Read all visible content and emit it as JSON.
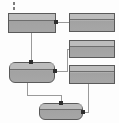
{
  "diagram": {
    "background_color": "#fdfdfd",
    "node_fill_color": "#a8a8a8",
    "node_border_color": "#5a5a5a",
    "edge_color": "#9a9a9a",
    "port_color": "#2e2e2e",
    "nodes": [
      {
        "id": "n1",
        "label": "",
        "shape": "rectangle",
        "x": 8,
        "y": 13,
        "w": 48,
        "h": 20
      },
      {
        "id": "n2",
        "label": "",
        "shape": "rectangle",
        "x": 69,
        "y": 13,
        "w": 46,
        "h": 19
      },
      {
        "id": "n3",
        "label": "",
        "shape": "rectangle",
        "x": 69,
        "y": 40,
        "w": 46,
        "h": 18
      },
      {
        "id": "n4",
        "label": "",
        "shape": "rectangle",
        "x": 69,
        "y": 65,
        "w": 46,
        "h": 19
      },
      {
        "id": "n5",
        "label": "",
        "shape": "rounded",
        "x": 9,
        "y": 62,
        "w": 46,
        "h": 21
      },
      {
        "id": "n6",
        "label": "",
        "shape": "rounded",
        "x": 39,
        "y": 103,
        "w": 44,
        "h": 17
      }
    ],
    "edges": [
      {
        "id": "e1",
        "from": "n1",
        "to": "n2",
        "style": "orthogonal"
      },
      {
        "id": "e2",
        "from": "n1",
        "to": "n5",
        "style": "orthogonal"
      },
      {
        "id": "e3",
        "from": "n5",
        "to": "n3",
        "style": "orthogonal"
      },
      {
        "id": "e4",
        "from": "n5",
        "to": "n6",
        "style": "orthogonal"
      },
      {
        "id": "e5",
        "from": "n4",
        "to": "n6",
        "style": "orthogonal"
      }
    ],
    "marks": [
      {
        "id": "m1",
        "kind": "dash-tick",
        "x": 13,
        "y": 2,
        "h": 3
      },
      {
        "id": "m2",
        "kind": "dash-tick",
        "x": 13,
        "y": 7,
        "h": 3
      }
    ]
  }
}
